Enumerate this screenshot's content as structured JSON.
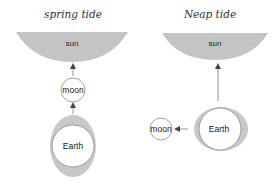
{
  "colors": {
    "sun_fill": "#c4c4c4",
    "tidal_bulge": "#c8c8c8",
    "outline": "#8a8a8a",
    "arrow": "#555555",
    "text": "#222222"
  },
  "panels": [
    {
      "title": "spring tide",
      "sun_label": "sun",
      "moon_label": "moon",
      "earth_label": "Earth"
    },
    {
      "title": "Neap tide",
      "sun_label": "sun",
      "moon_label": "moon",
      "earth_label": "Earth"
    }
  ]
}
